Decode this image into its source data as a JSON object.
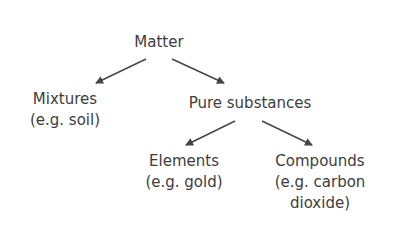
{
  "diagram": {
    "type": "tree",
    "root": {
      "label": "Matter"
    },
    "mixtures": {
      "label": "Mixtures",
      "example": "(e.g. soil)"
    },
    "pure": {
      "label": "Pure substances"
    },
    "elements": {
      "label": "Elements",
      "example": "(e.g. gold)"
    },
    "compounds": {
      "label": "Compounds",
      "example_line1": "(e.g. carbon",
      "example_line2": "dioxide)"
    },
    "edges": [
      {
        "from": "Matter",
        "to": "Mixtures"
      },
      {
        "from": "Matter",
        "to": "Pure substances"
      },
      {
        "from": "Pure substances",
        "to": "Elements"
      },
      {
        "from": "Pure substances",
        "to": "Compounds"
      }
    ],
    "colors": {
      "text": "#3d3d3d",
      "arrow": "#444444",
      "background": "#ffffff"
    }
  }
}
